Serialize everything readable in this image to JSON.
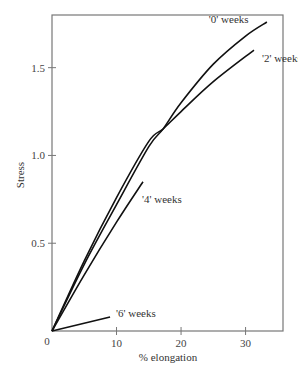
{
  "chart_data": {
    "type": "line",
    "title": "",
    "xlabel": "% elongation",
    "ylabel": "Stress",
    "xlim": [
      0,
      35.8
    ],
    "ylim": [
      0,
      1.8
    ],
    "x_ticks": [
      10,
      20,
      30
    ],
    "x_tick_labels": [
      "10",
      "20",
      "30"
    ],
    "y_ticks": [
      0.5,
      1.0,
      1.5
    ],
    "y_tick_labels": [
      "0.5",
      "1.0",
      "1.5"
    ],
    "origin_label": "0",
    "grid": false,
    "legend": "inline labels at curve ends",
    "series": [
      {
        "name": "'0' weeks",
        "label": "'0' weeks",
        "x": [
          0,
          5,
          10,
          15,
          17.2,
          20,
          25,
          30,
          33.3
        ],
        "y": [
          0,
          0.38,
          0.72,
          1.05,
          1.15,
          1.3,
          1.52,
          1.68,
          1.76
        ]
      },
      {
        "name": "'2' weeks",
        "label": "'2' weeks",
        "x": [
          0,
          5,
          10,
          15,
          17.2,
          20,
          25,
          31.3
        ],
        "y": [
          0,
          0.4,
          0.76,
          1.08,
          1.15,
          1.25,
          1.42,
          1.6
        ]
      },
      {
        "name": "'4' weeks",
        "label": "'4' weeks",
        "x": [
          0,
          5,
          10,
          14.1
        ],
        "y": [
          0,
          0.32,
          0.62,
          0.85
        ]
      },
      {
        "name": "'6' weeks",
        "label": "'6' weeks",
        "x": [
          0,
          9
        ],
        "y": [
          0,
          0.08
        ]
      }
    ]
  },
  "colors": {
    "line": "#111111",
    "axis": "#777777"
  }
}
